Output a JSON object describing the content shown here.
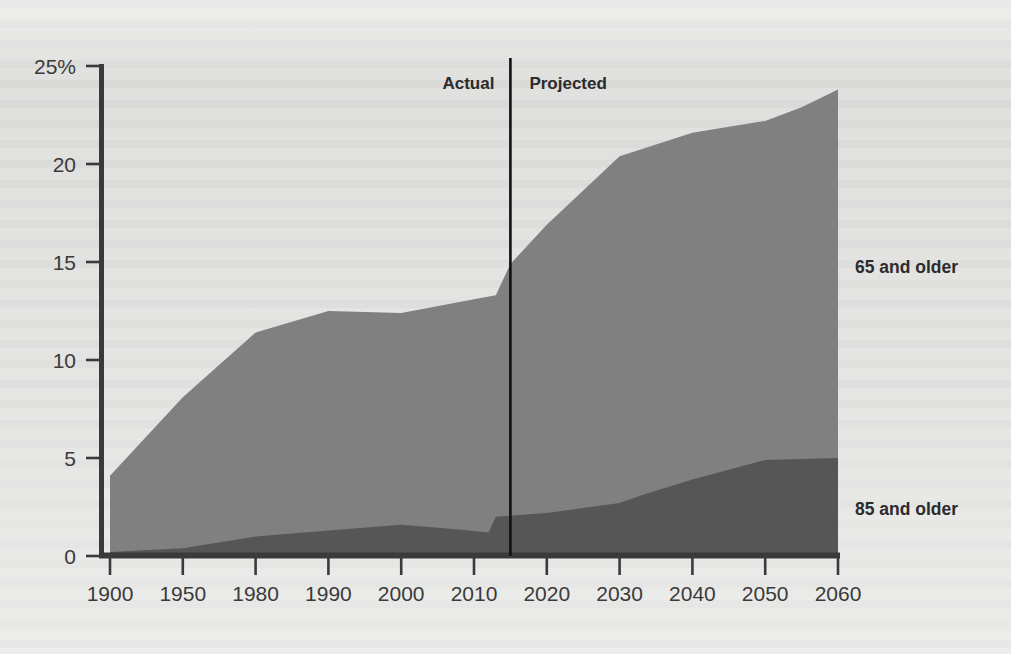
{
  "chart_data": {
    "type": "area",
    "stacked": true,
    "title": "",
    "subtitle": "",
    "xlabel": "",
    "ylabel": "",
    "categories": [
      "1900",
      "1950",
      "1980",
      "1990",
      "2000",
      "2010",
      "2020",
      "2030",
      "2040",
      "2050",
      "2060"
    ],
    "x_tick_labels": [
      "1900",
      "1950",
      "1980",
      "1990",
      "2000",
      "2010",
      "2020",
      "2030",
      "2040",
      "2050",
      "2060"
    ],
    "y_tick_labels": [
      "25%",
      "20",
      "15",
      "10",
      "5",
      "0"
    ],
    "y_ticks": [
      25,
      20,
      15,
      10,
      5,
      0
    ],
    "ylim": [
      0,
      25
    ],
    "grid": false,
    "legend_position": "right-inline",
    "series": [
      {
        "name": "65 and older",
        "color": "#808080",
        "label": "65 and older",
        "values": [
          4.1,
          8.1,
          11.4,
          12.5,
          12.4,
          13.1,
          16.9,
          20.4,
          21.6,
          22.2,
          23.8
        ]
      },
      {
        "name": "85 and older",
        "color": "#565656",
        "label": "85 and older",
        "values": [
          0.2,
          0.4,
          1.0,
          1.3,
          1.6,
          1.2,
          2.2,
          2.7,
          3.9,
          4.9,
          5.0
        ]
      }
    ],
    "points": {
      "total_65_plus": [
        {
          "x": 1900,
          "y": 4.1
        },
        {
          "x": 1950,
          "y": 8.1
        },
        {
          "x": 1980,
          "y": 11.4
        },
        {
          "x": 1990,
          "y": 12.5
        },
        {
          "x": 2000,
          "y": 12.4
        },
        {
          "x": 2010,
          "y": 13.1
        },
        {
          "x": 2013,
          "y": 13.3
        },
        {
          "x": 2015,
          "y": 14.9
        },
        {
          "x": 2020,
          "y": 16.9
        },
        {
          "x": 2030,
          "y": 20.4
        },
        {
          "x": 2035,
          "y": 21.0
        },
        {
          "x": 2040,
          "y": 21.6
        },
        {
          "x": 2050,
          "y": 22.2
        },
        {
          "x": 2055,
          "y": 22.9
        },
        {
          "x": 2060,
          "y": 23.8
        }
      ],
      "total_85_plus": [
        {
          "x": 1900,
          "y": 0.2
        },
        {
          "x": 1950,
          "y": 0.4
        },
        {
          "x": 1980,
          "y": 1.0
        },
        {
          "x": 1990,
          "y": 1.3
        },
        {
          "x": 2000,
          "y": 1.6
        },
        {
          "x": 2008,
          "y": 1.35
        },
        {
          "x": 2012,
          "y": 1.2
        },
        {
          "x": 2013,
          "y": 2.0
        },
        {
          "x": 2020,
          "y": 2.2
        },
        {
          "x": 2030,
          "y": 2.7
        },
        {
          "x": 2033,
          "y": 3.1
        },
        {
          "x": 2040,
          "y": 3.9
        },
        {
          "x": 2050,
          "y": 4.9
        },
        {
          "x": 2060,
          "y": 5.0
        }
      ]
    },
    "annotations": [
      {
        "name": "actual-label",
        "text": "Actual",
        "x": 2010
      },
      {
        "name": "projected-label",
        "text": "Projected",
        "x": 2016
      }
    ],
    "divider": {
      "name": "actual-projected-divider",
      "x": 2015,
      "label_left": "Actual",
      "label_right": "Projected",
      "color": "#111111"
    },
    "colors": {
      "background": "#d9d9d7",
      "axis": "#333333",
      "band_65_plus": "#808080",
      "band_85_plus": "#565656",
      "text": "#2f2f2f"
    }
  },
  "legend": {
    "items": [
      {
        "label": "65 and older",
        "color": "#808080"
      },
      {
        "label": "85 and older",
        "color": "#565656"
      }
    ]
  }
}
